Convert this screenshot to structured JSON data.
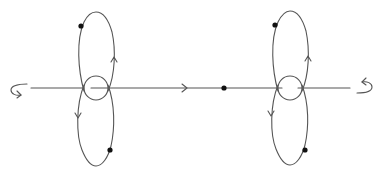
{
  "caption_fragment": "",
  "colors": {
    "stroke": "#555555",
    "dot": "#111111",
    "background": "#ffffff"
  },
  "diagram": {
    "axis": {
      "x1": 31,
      "x2": 350,
      "y": 88,
      "arrow_at_x": 186,
      "direction": "right"
    },
    "center_dot": {
      "x": 224,
      "y": 88
    },
    "figures": [
      {
        "name": "left-figure",
        "cx": 96,
        "top_loop": {
          "rx": 19,
          "top": 12,
          "arrow": "up",
          "dot": {
            "x": 81,
            "y": 26
          }
        },
        "bottom_loop": {
          "rx": 19,
          "bottom": 166,
          "arrow": "down",
          "dot": {
            "x": 110,
            "y": 150
          }
        },
        "small_circle_r": 12
      },
      {
        "name": "right-figure",
        "cx": 290,
        "top_loop": {
          "rx": 19,
          "top": 11,
          "arrow": "up",
          "dot": {
            "x": 275,
            "y": 25
          }
        },
        "bottom_loop": {
          "rx": 19,
          "bottom": 165,
          "arrow": "down",
          "dot": {
            "x": 305,
            "y": 150
          }
        },
        "small_circle_r": 12
      }
    ],
    "end_rotations": [
      {
        "name": "left-rotation-arrow",
        "side": "left"
      },
      {
        "name": "right-rotation-arrow",
        "side": "right"
      }
    ]
  }
}
